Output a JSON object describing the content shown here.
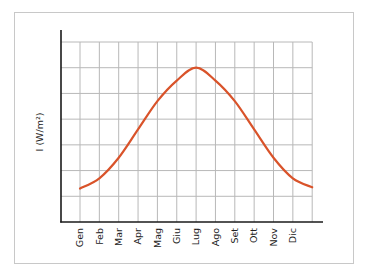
{
  "chart_data": {
    "type": "line",
    "title": "",
    "xlabel": "",
    "ylabel": "I (W/m²)",
    "categories": [
      "Gen",
      "Feb",
      "Mar",
      "Apr",
      "Mag",
      "Giu",
      "Lug",
      "Ago",
      "Set",
      "Ott",
      "Nov",
      "Dic"
    ],
    "series": [
      {
        "name": "Irradianza solare",
        "color": "#d9532a",
        "values": [
          1.3,
          1.7,
          2.5,
          3.6,
          4.7,
          5.5,
          6.0,
          5.5,
          4.7,
          3.6,
          2.5,
          1.7
        ],
        "end_value": 1.35
      }
    ],
    "ylim": [
      0,
      7
    ],
    "y_ticks_labeled": false,
    "grid": true,
    "grid_rows": 7,
    "grid_cols": 12,
    "legend": null
  },
  "colors": {
    "curve": "#d9532a",
    "grid": "#b8b8b8",
    "axis": "#1a1a1a",
    "frame": "#c8c8c8"
  }
}
